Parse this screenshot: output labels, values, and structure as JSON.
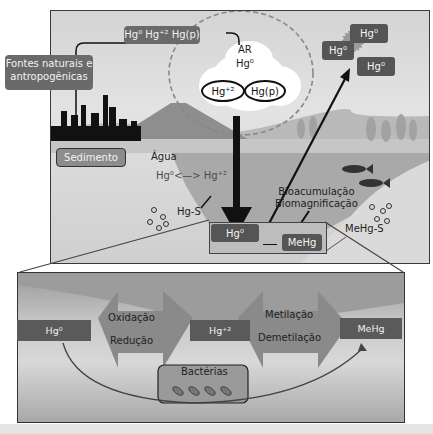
{
  "diagram": {
    "colors": {
      "frame": "#3a3a3a",
      "label_box": "#6a6a6a",
      "dark_box": "#555555",
      "water": "#a8a8a8",
      "sediment": "#dcdcdc",
      "sky": "#e3e3e3",
      "arrow": "#111111"
    },
    "sources": {
      "label": "Fontes naturais e antropogênicas",
      "emissions_label": "Hg⁰ Hg⁺² Hg(p)"
    },
    "air": {
      "label": "AR",
      "species_top": "Hg⁰",
      "species_left": "Hg⁺²",
      "species_right": "Hg(p)"
    },
    "atmosphere_release": [
      "Hg⁰",
      "Hg⁰",
      "Hg⁰"
    ],
    "sediment_label": "Sedimento",
    "water": {
      "label": "Água",
      "equilibrium": "Hg⁰<—> Hg⁺²",
      "sulfide": "Hg-S"
    },
    "biota": {
      "line1": "Bioacumulação",
      "line2": "Biomagnificação"
    },
    "bottom_box": {
      "left": "Hg⁰",
      "right": "MeHg",
      "sulfide": "MeHg-S"
    },
    "inset": {
      "nodes": [
        "Hg⁰",
        "Hg⁺²",
        "MeHg"
      ],
      "process1_top": "Oxidação",
      "process1_bottom": "Redução",
      "process2_top": "Metilação",
      "process2_bottom": "Demetilação",
      "bacteria_label": "Bactérias"
    }
  }
}
